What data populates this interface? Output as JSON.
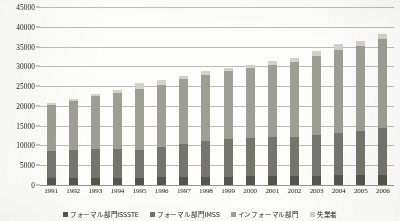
{
  "chart_data": {
    "type": "bar",
    "stacked": true,
    "title": "",
    "xlabel": "",
    "ylabel": "",
    "ylim": [
      0,
      45000
    ],
    "ytick_step": 5000,
    "grid": true,
    "legend_position": "bottom",
    "categories": [
      "1991",
      "1992",
      "1993",
      "1994",
      "1995",
      "1996",
      "1997",
      "1998",
      "1999",
      "2000",
      "2001",
      "2002",
      "2003",
      "2004",
      "2005",
      "2006"
    ],
    "ytick_labels": [
      "0",
      "5000",
      "10000",
      "15000",
      "20000",
      "25000",
      "30000",
      "35000",
      "40000",
      "45000"
    ],
    "series": [
      {
        "name": "フォーマル部門ISSSTE",
        "color": "#55554f",
        "values": [
          2450,
          2500,
          2550,
          2500,
          2450,
          2500,
          2550,
          2600,
          2600,
          2650,
          2700,
          2700,
          2750,
          2800,
          2800,
          2850
        ]
      },
      {
        "name": "フォーマル部門IMSS",
        "color": "#75756d",
        "values": [
          10050,
          10100,
          10050,
          9900,
          9350,
          10150,
          10750,
          11200,
          11700,
          11950,
          11800,
          11700,
          11750,
          12000,
          12300,
          12750
        ]
      },
      {
        "name": "インフォーマル部門",
        "color": "#9e9e95",
        "values": [
          17450,
          18000,
          18800,
          19450,
          20400,
          20400,
          20850,
          21100,
          21100,
          21400,
          21800,
          22300,
          23100,
          23700,
          24000,
          24550
        ]
      },
      {
        "name": "失業者",
        "color": "#d2d2c9",
        "values": [
          600,
          650,
          800,
          950,
          1800,
          1450,
          1150,
          1100,
          1100,
          1000,
          1200,
          1300,
          1400,
          1500,
          1400,
          1350
        ]
      }
    ],
    "totals": [
      30550,
      31250,
      32200,
      32800,
      34000,
      34500,
      35300,
      36000,
      36500,
      37000,
      37500,
      38000,
      39000,
      40000,
      40500,
      41500
    ]
  },
  "legend": {
    "items": [
      {
        "label": "フォーマル部門ISSSTE",
        "color": "#55554f"
      },
      {
        "label": "フォーマル部門IMSS",
        "color": "#75756d"
      },
      {
        "label": "インフォーマル部門",
        "color": "#9e9e95"
      },
      {
        "label": "失業者",
        "color": "#d2d2c9"
      }
    ]
  }
}
